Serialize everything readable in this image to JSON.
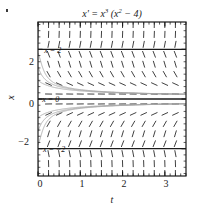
{
  "figure": {
    "title_prefix": "x' = x",
    "title_exp1": "3",
    "title_mid": " (x",
    "title_exp2": "2",
    "title_suffix": " − 4)",
    "title_plain": "x' = x3 (x2 − 4)"
  },
  "axes": {
    "x_title": "t",
    "y_title": "x",
    "x_ticks": [
      "0",
      "1",
      "2",
      "3"
    ],
    "y_ticks": [
      "2",
      "0",
      "−2"
    ],
    "x_tick_values": [
      0,
      1,
      2,
      3
    ],
    "y_tick_values": [
      2,
      0,
      -2
    ],
    "xlim": [
      0,
      3.5
    ],
    "ylim": [
      -3.1,
      3.1
    ],
    "minor_ticks": true,
    "frame": true
  },
  "annotations": [
    {
      "label": "x = 2",
      "x": 0.35,
      "y": 2.0,
      "name": "equilibrium-label-x-eq-2"
    },
    {
      "label": "x = 0",
      "x": 0.3,
      "y": 0.0,
      "name": "equilibrium-label-x-eq-0"
    },
    {
      "label": "x = −2",
      "x": 0.38,
      "y": -2.0,
      "name": "equilibrium-label-x-eq-neg2"
    }
  ],
  "chart_data": {
    "type": "line",
    "title": "x' = x3 (x2 − 4)",
    "xlabel": "t",
    "ylabel": "x",
    "xlim": [
      0,
      3.5
    ],
    "ylim": [
      -3.1,
      3.1
    ],
    "grid": false,
    "legend": null,
    "equation": "x' = x^3 (x^2 - 4)",
    "equilibria": [
      {
        "x": 2,
        "label": "x = 2",
        "stability": "unstable"
      },
      {
        "x": 0,
        "label": "x = 0",
        "stability": "unstable"
      },
      {
        "x": -2,
        "label": "x = −2",
        "stability": "unstable"
      }
    ],
    "slope_field": {
      "x_samples": [
        0.0,
        0.25,
        0.5,
        0.75,
        1.0,
        1.25,
        1.5,
        1.75,
        2.0,
        2.25,
        2.5,
        2.75,
        3.0,
        3.25,
        3.5
      ],
      "y_samples": [
        -3.0,
        -2.6,
        -2.2,
        -1.8,
        -1.4,
        -1.0,
        -0.6,
        -0.2,
        0.2,
        0.6,
        1.0,
        1.4,
        1.8,
        2.2,
        2.6,
        3.0
      ],
      "slope_rule": "dx/dt = x^3 * (x^2 - 4)",
      "sign_regions": [
        {
          "range": "x > 2",
          "sign": "positive",
          "note": "steeply increasing, near vertical"
        },
        {
          "range": "0 < x < 2",
          "sign": "negative",
          "note": "decreasing toward x = 0"
        },
        {
          "range": "-2 < x < 0",
          "sign": "positive",
          "note": "increasing toward x = 0"
        },
        {
          "range": "x < -2",
          "sign": "negative",
          "note": "steeply decreasing, near vertical"
        }
      ]
    },
    "solution_curves": [
      {
        "name": "above-upper-equilibrium",
        "x0": 0.0,
        "y0": 2.35,
        "direction": "blows up upward"
      },
      {
        "name": "above-upper-equilibrium-2",
        "x0": 0.0,
        "y0": 2.8,
        "direction": "blows up upward"
      },
      {
        "name": "decaying-to-zero-high",
        "x0": 0.0,
        "y0": 1.85,
        "direction": "falls to x = 0"
      },
      {
        "name": "decaying-to-zero-mid",
        "x0": 0.0,
        "y0": 1.3,
        "direction": "falls to x = 0"
      },
      {
        "name": "decaying-to-zero-low",
        "x0": 0.0,
        "y0": 0.75,
        "direction": "falls to x = 0"
      },
      {
        "name": "rising-to-zero-low",
        "x0": 0.0,
        "y0": -0.75,
        "direction": "rises to x = 0"
      },
      {
        "name": "rising-to-zero-mid",
        "x0": 0.0,
        "y0": -1.3,
        "direction": "rises to x = 0"
      },
      {
        "name": "rising-to-zero-high",
        "x0": 0.0,
        "y0": -1.85,
        "direction": "rises to x = 0"
      },
      {
        "name": "below-lower-equilibrium",
        "x0": 0.0,
        "y0": -2.35,
        "direction": "blows down"
      },
      {
        "name": "below-lower-equilibrium-2",
        "x0": 0.0,
        "y0": -2.8,
        "direction": "blows down"
      }
    ]
  },
  "colors": {
    "axis": "#1a1a1a",
    "tick": "#1a1a1a",
    "slope_mark": "#2b2b2b",
    "curve": "#9a9a9a",
    "equilibrium": "#1a1a1a",
    "background": "#ffffff"
  }
}
